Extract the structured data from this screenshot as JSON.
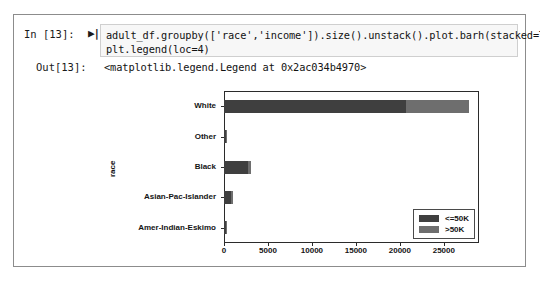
{
  "notebook": {
    "input_prompt": "In [13]:",
    "run_marker": "▶|",
    "code_lines": [
      "adult_df.groupby(['race','income']).size().unstack().plot.barh(stacked=True)",
      "plt.legend(loc=4)"
    ],
    "output_prompt": "Out[13]:",
    "output_text": "<matplotlib.legend.Legend at 0x2ac034b4970>"
  },
  "chart_data": {
    "type": "bar",
    "orientation": "horizontal",
    "stacked": true,
    "title": "",
    "xlabel": "",
    "ylabel": "race",
    "categories": [
      "Amer-Indian-Eskimo",
      "Asian-Pac-Islander",
      "Black",
      "Other",
      "White"
    ],
    "series": [
      {
        "name": "<=50K",
        "color": "#3f3f3f",
        "values": [
          275,
          763,
          2737,
          246,
          20699
        ]
      },
      {
        "name": ">50K",
        "color": "#6e6e6e",
        "values": [
          36,
          276,
          387,
          25,
          7117
        ]
      }
    ],
    "xticks": [
      "0",
      "5000",
      "10000",
      "15000",
      "20000",
      "25000"
    ],
    "xtick_values": [
      0,
      5000,
      10000,
      15000,
      20000,
      25000
    ],
    "xlim": [
      0,
      29000
    ],
    "grid": false,
    "legend_position": "lower right",
    "legend_entries": [
      "<=50K",
      ">50K"
    ]
  },
  "colors": {
    "bar_low": "#3f3f3f",
    "bar_high": "#6e6e6e",
    "axis": "#2b2b2b",
    "code_bg": "#f7f7f7",
    "frame": "#8c8c8c"
  }
}
